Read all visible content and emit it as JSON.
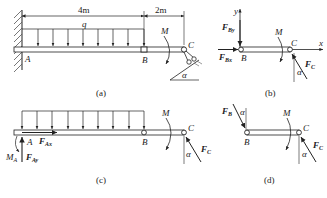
{
  "figures": [
    {
      "id": "a",
      "caption": "(a)",
      "dimensions": [
        "4m",
        "2m"
      ],
      "load_label": "q",
      "moment_label": "M",
      "points": [
        "A",
        "B",
        "C"
      ],
      "angle_label": "α"
    },
    {
      "id": "b",
      "caption": "(b)",
      "axes": {
        "y": "y",
        "x": "x"
      },
      "forces": {
        "FBy": {
          "main": "F",
          "sub": "By"
        },
        "FBx": {
          "main": "F",
          "sub": "Bx"
        },
        "FC": {
          "main": "F",
          "sub": "C"
        }
      },
      "moment_label": "M",
      "points": [
        "B",
        "C"
      ],
      "angle_label": "α"
    },
    {
      "id": "c",
      "caption": "(c)",
      "forces": {
        "FAx": {
          "main": "F",
          "sub": "Ax"
        },
        "FAy": {
          "main": "F",
          "sub": "Ay"
        },
        "FC": {
          "main": "F",
          "sub": "C"
        }
      },
      "reaction_moment": {
        "main": "M",
        "sub": "A"
      },
      "moment_label": "M",
      "points": [
        "A",
        "B",
        "C"
      ],
      "angle_label": "α"
    },
    {
      "id": "d",
      "caption": "(d)",
      "forces": {
        "FB": {
          "main": "F",
          "sub": "B"
        },
        "FC": {
          "main": "F",
          "sub": "C"
        }
      },
      "moment_label": "M",
      "points": [
        "B",
        "C"
      ],
      "angle_labels": [
        "α",
        "α"
      ]
    }
  ],
  "colors": {
    "line": "#222222",
    "hatch": "#555555",
    "background": "#ffffff"
  }
}
